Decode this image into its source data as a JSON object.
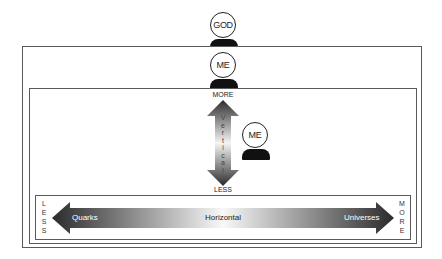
{
  "figures": {
    "top": {
      "label": "GOD"
    },
    "outer": {
      "label": "ME"
    },
    "inner": {
      "label": "ME"
    }
  },
  "vertical_axis": {
    "top_label": "MORE",
    "bottom_label": "LESS",
    "name_letters": [
      "V",
      "e",
      "r",
      "t",
      "i",
      "c",
      "a",
      "l"
    ]
  },
  "horizontal_axis": {
    "left_letters": [
      "L",
      "E",
      "S",
      "S"
    ],
    "right_letters": [
      "M",
      "O",
      "R",
      "E"
    ],
    "left_end_label": "Quarks",
    "center_label": "Horizontal",
    "right_end_label": "Universes"
  },
  "colors": {
    "arrow_dark": "#2b2b2b",
    "arrow_light": "#f5f5f5",
    "frame": "#5a5a5a"
  }
}
